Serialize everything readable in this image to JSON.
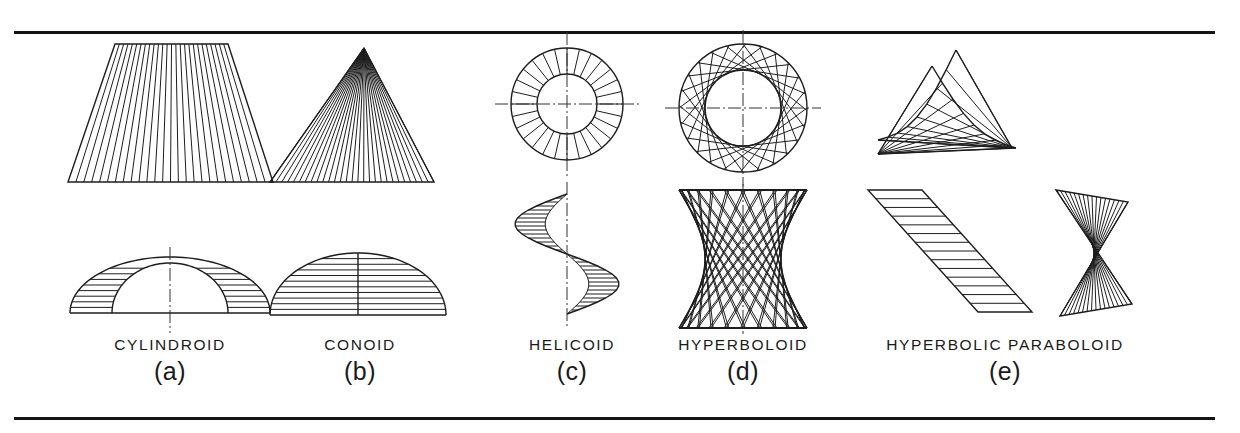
{
  "plate": {
    "title": "Warped ruled surfaces — orthographic plate",
    "border_color": "#141414",
    "line_color": "#1d1d1d",
    "background": "#ffffff",
    "rules": {
      "top_y": 31,
      "bottom_y": 417,
      "left_x": 14,
      "width": 1201
    }
  },
  "figures": [
    {
      "letter": "(a)",
      "name": "CYLINDROID",
      "center_x": 170,
      "views": {
        "front": "trapezoid with vertical ruling elements",
        "top": "nested semi-ellipses with horizontal ruling, vertical center line"
      },
      "ruling_count_front": 26,
      "ruling_count_top": 9
    },
    {
      "letter": "(b)",
      "name": "CONOID",
      "center_x": 360,
      "views": {
        "front": "triangle with elements converging to apex",
        "top": "semi-ellipse with horizontal ruling, solid vertical center line"
      },
      "ruling_count_front": 28,
      "ruling_count_top": 10
    },
    {
      "letter": "(c)",
      "name": "HELICOID",
      "center_x": 572,
      "views": {
        "top": "annulus with radial elements and crosshair center lines",
        "front": "helical ribbon with radial ruling elements"
      },
      "ruling_count_top": 28,
      "ruling_count_front": 30
    },
    {
      "letter": "(d)",
      "name": "HYPERBOLOID",
      "center_x": 743,
      "views": {
        "top": "circle with chord envelope tangent to inner throat circle",
        "front": "hourglass profile with two crossing families of straight elements"
      },
      "ruling_count_top": 24,
      "ruling_count_front": 48
    },
    {
      "letter": "(e)",
      "name": "HYPERBOLIC PARABOLOID",
      "center_x": 1000,
      "views": {
        "top": "two saddle fan panels meeting at a ridge",
        "front_left": "slanted parallelogram with parallel elements",
        "front_right": "bowtie with crossing elements"
      },
      "ruling_count_top": 16,
      "ruling_count_front_left": 14,
      "ruling_count_front_right": 16
    }
  ]
}
